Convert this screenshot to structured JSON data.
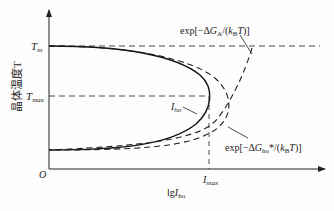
{
  "diagram": {
    "y_axis_label": "晶体温度T",
    "x_axis_label": "lg I_ho",
    "origin": "O",
    "y_ticks": [
      "T_m",
      "T_max"
    ],
    "x_ticks": [
      "I_max"
    ],
    "curves": [
      {
        "name": "I_ho",
        "style": "solid",
        "label": "I_ho"
      },
      {
        "name": "exp_GA",
        "style": "dashed",
        "label": "exp[-ΔG_A/(k_B T)]"
      },
      {
        "name": "exp_Gho",
        "style": "dashed",
        "label": "exp[-ΔG*_ho/(k_B T)]"
      }
    ],
    "colors": {
      "line": "#222222",
      "background": "#fdfdfd"
    }
  }
}
